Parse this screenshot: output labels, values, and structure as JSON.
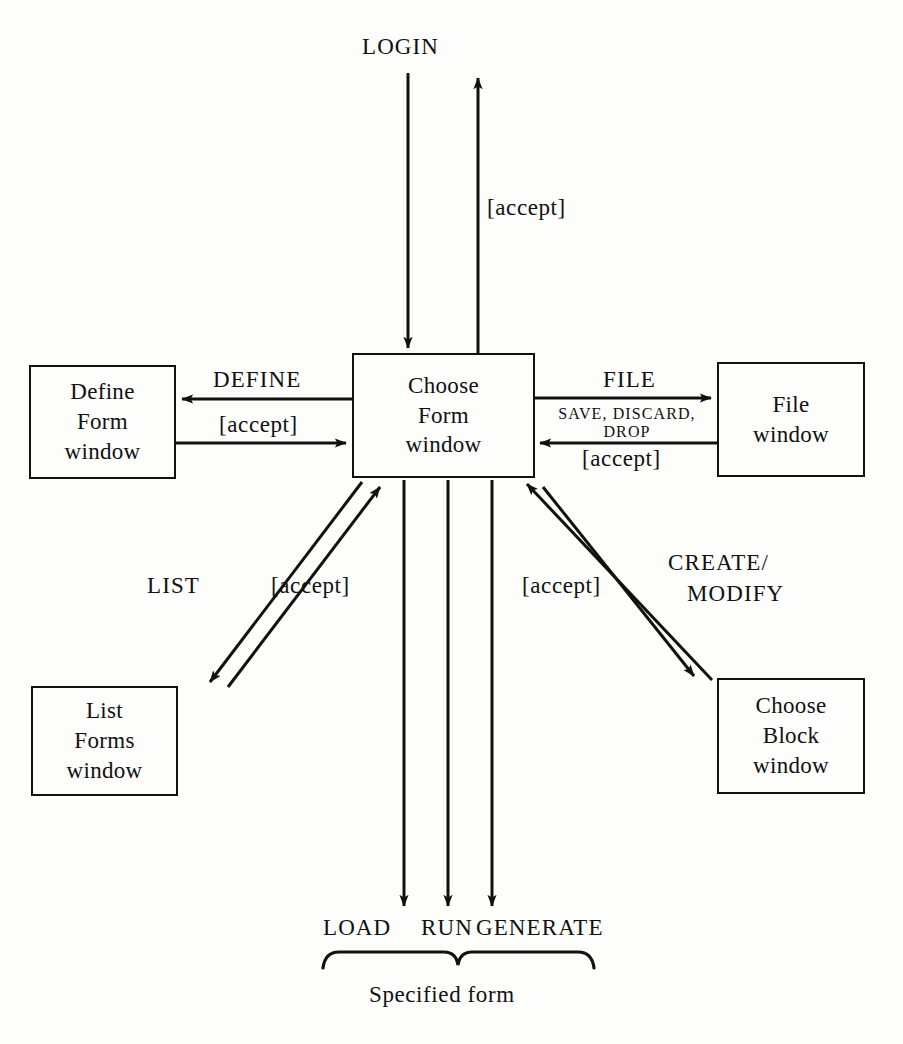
{
  "diagram": {
    "background_color": "#fdfdfb",
    "line_color": "#111111",
    "nodes": [
      {
        "id": "choose-form",
        "lines": [
          "Choose",
          "Form",
          "window"
        ]
      },
      {
        "id": "define-form",
        "lines": [
          "Define",
          "Form",
          "window"
        ]
      },
      {
        "id": "file",
        "lines": [
          "File",
          "window"
        ]
      },
      {
        "id": "list-forms",
        "lines": [
          "List",
          "Forms",
          "window"
        ]
      },
      {
        "id": "choose-block",
        "lines": [
          "Choose",
          "Block",
          "window"
        ]
      }
    ],
    "edge_labels": {
      "login": "LOGIN",
      "login_accept": "[accept]",
      "define": "DEFINE",
      "define_accept": "[accept]",
      "file": "FILE",
      "file_commands": "SAVE, DISCARD,\nDROP",
      "file_commands_line1": "SAVE, DISCARD,",
      "file_commands_line2": "DROP",
      "file_accept": "[accept]",
      "list": "LIST",
      "list_accept": "[accept]",
      "create_modify_line1": "CREATE/",
      "create_modify_line2": "MODIFY",
      "create_modify_accept": "[accept]",
      "load": "LOAD",
      "run": "RUN",
      "generate": "GENERATE",
      "specified_form": "Specified form"
    }
  }
}
